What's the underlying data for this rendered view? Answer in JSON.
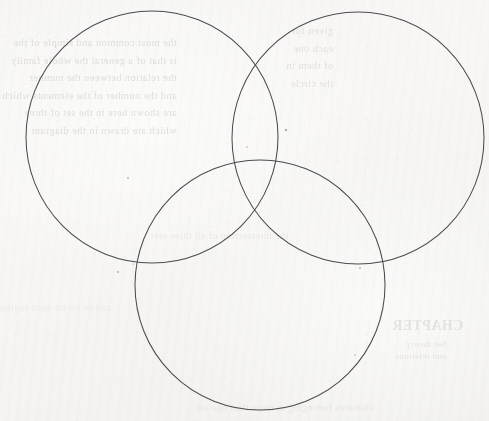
{
  "document": {
    "kind": "scanned-paper-page",
    "title": "Three-circle Venn diagram",
    "surface_color": "#f6f5f3",
    "ink_color": "#4b4b51",
    "showthrough_color": "#b9b5ad",
    "width": 489,
    "height": 421
  },
  "diagram": {
    "type": "venn-3-set",
    "stroke_color": "#4b4b51",
    "stroke_width": 1.05,
    "fill": "none",
    "circles": [
      {
        "id": "top-left",
        "label": "",
        "cx": 152,
        "cy": 137,
        "r": 126
      },
      {
        "id": "top-right",
        "label": "",
        "cx": 358,
        "cy": 138,
        "r": 126
      },
      {
        "id": "bottom",
        "label": "",
        "cx": 260,
        "cy": 285,
        "r": 125
      }
    ],
    "regions": [
      {
        "id": "A-only",
        "label": ""
      },
      {
        "id": "B-only",
        "label": ""
      },
      {
        "id": "C-only",
        "label": ""
      },
      {
        "id": "A-and-B",
        "label": ""
      },
      {
        "id": "A-and-C",
        "label": ""
      },
      {
        "id": "B-and-C",
        "label": ""
      },
      {
        "id": "A-B-and-C",
        "label": ""
      }
    ]
  },
  "specks": [
    {
      "cx": 286,
      "cy": 130,
      "r": 1.25
    },
    {
      "cx": 128,
      "cy": 178,
      "r": 1.0
    },
    {
      "cx": 118,
      "cy": 272,
      "r": 1.0
    },
    {
      "cx": 360,
      "cy": 268,
      "r": 0.9
    },
    {
      "cx": 247,
      "cy": 147,
      "r": 0.8
    },
    {
      "cx": 355,
      "cy": 355,
      "r": 0.8
    },
    {
      "cx": 133,
      "cy": 264,
      "r": 0.7
    }
  ],
  "showthrough": {
    "note": "faint mirrored text bleeding through from the reverse side of the sheet; illegible",
    "top_left_lines": [
      "the most common and simple of the",
      "is that of a general the whole family",
      "the relation between the number",
      "and the number of the elements which",
      "are shown here in the set of three",
      "which are drawn in the diagram"
    ],
    "top_right_lines": [
      "given for",
      "each one",
      "of them in",
      "the circle"
    ],
    "heading": "CHAPTER",
    "heading_sub_lines": [
      "Set theory",
      "and relations"
    ],
    "middle_lines": [
      "the intersection of all three sets"
    ],
    "bottom_lines": [
      "elements belonging to more than one set"
    ],
    "left_low_lines": [
      "and so on for each region"
    ]
  }
}
